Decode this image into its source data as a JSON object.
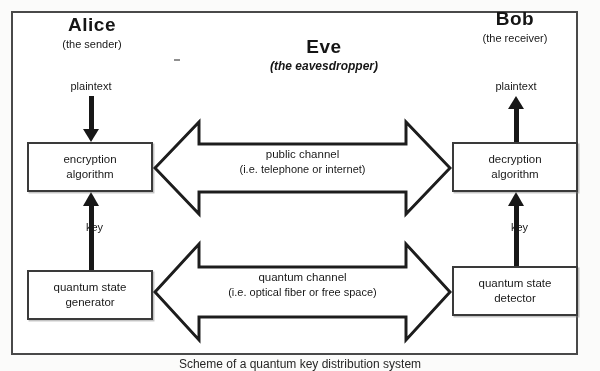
{
  "diagram": {
    "title_caption": "Scheme of a quantum key distribution system",
    "frame": {
      "border_color": "#4c4c4c"
    },
    "parties": [
      {
        "id": "alice",
        "name": "Alice",
        "role": "(the sender)",
        "italic_role": false
      },
      {
        "id": "eve",
        "name": "Eve",
        "role": "(the eavesdropper)",
        "italic_role": true
      },
      {
        "id": "bob",
        "name": "Bob",
        "role": "(the receiver)",
        "italic_role": false
      }
    ],
    "boxes": [
      {
        "id": "encryption",
        "line1": "encryption",
        "line2": "algorithm"
      },
      {
        "id": "decryption",
        "line1": "decryption",
        "line2": "algorithm"
      },
      {
        "id": "state-generator",
        "line1": "quantum state",
        "line2": "generator"
      },
      {
        "id": "state-detector",
        "line1": "quantum state",
        "line2": "detector"
      }
    ],
    "flow_labels": {
      "plaintext_alice": "plaintext",
      "plaintext_bob": "plaintext",
      "key_alice": "key",
      "key_bob": "key"
    },
    "channels": [
      {
        "id": "public",
        "line1": "public channel",
        "line2": "(i.e. telephone or internet)",
        "direction": "bidirectional"
      },
      {
        "id": "quantum",
        "line1": "quantum channel",
        "line2": "(i.e. optical fiber or free space)",
        "direction": "bidirectional"
      }
    ],
    "colors": {
      "ink": "#1a1a1a",
      "box_border": "#3d3d3d",
      "background": "#fdfdfc"
    }
  }
}
